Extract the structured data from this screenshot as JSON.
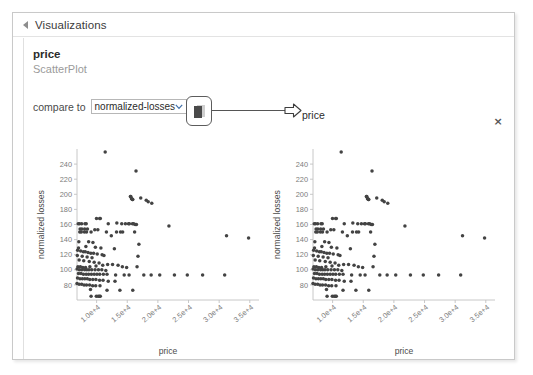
{
  "panel": {
    "title": "Visualizations",
    "collapse_icon": "triangle-right-icon"
  },
  "meta": {
    "series_name": "price",
    "plot_type": "ScatterPlot"
  },
  "compare": {
    "label": "compare to",
    "selected": "normalized-losses",
    "options": [
      "normalized-losses",
      "price",
      "symboling",
      "wheel-base",
      "curb-weight",
      "engine-size",
      "horsepower",
      "city-mpg",
      "highway-mpg"
    ],
    "chevron_icon": "chevron-down-icon"
  },
  "copy_button": {
    "icon": "copy-pages-icon",
    "label": ""
  },
  "annotation": {
    "arrow_icon": "arrow-right-outline-icon",
    "label": "price"
  },
  "close_button": {
    "label": "×",
    "icon": "close-icon"
  },
  "chart_data": [
    {
      "id": "scatter-left",
      "type": "scatter",
      "title": "",
      "xlabel": "price",
      "ylabel": "normalized losses",
      "xlim": [
        6800,
        36500
      ],
      "ylim": [
        60,
        260
      ],
      "xticks": [
        10000,
        15000,
        20000,
        25000,
        30000,
        35000
      ],
      "xticklabels": [
        "1.0e+4",
        "1.5e+4",
        "2.0e+4",
        "2.5e+4",
        "3.0e+4",
        "3.5e+4"
      ],
      "yticks": [
        80,
        100,
        120,
        140,
        160,
        180,
        200,
        220,
        240
      ],
      "yticklabels": [
        "80",
        "100",
        "120",
        "140",
        "160",
        "180",
        "200",
        "220",
        "240"
      ],
      "grid": false,
      "legend": null,
      "marker_color": "#434343",
      "points": [
        [
          11400,
          256
        ],
        [
          16430,
          231
        ],
        [
          15510,
          197
        ],
        [
          15580,
          197
        ],
        [
          15690,
          194
        ],
        [
          15750,
          194
        ],
        [
          15850,
          193
        ],
        [
          15900,
          193
        ],
        [
          17200,
          195
        ],
        [
          18100,
          192
        ],
        [
          18420,
          190
        ],
        [
          19000,
          188
        ],
        [
          9980,
          168
        ],
        [
          10500,
          168
        ],
        [
          10600,
          168
        ],
        [
          7000,
          161
        ],
        [
          7200,
          161
        ],
        [
          7550,
          161
        ],
        [
          8100,
          161
        ],
        [
          8300,
          161
        ],
        [
          11900,
          161
        ],
        [
          13300,
          162
        ],
        [
          14100,
          161
        ],
        [
          14700,
          161
        ],
        [
          15200,
          161
        ],
        [
          15350,
          161
        ],
        [
          15850,
          161
        ],
        [
          16050,
          161
        ],
        [
          16300,
          160
        ],
        [
          16500,
          160
        ],
        [
          7300,
          154
        ],
        [
          7600,
          154
        ],
        [
          8050,
          154
        ],
        [
          8500,
          154
        ],
        [
          9700,
          153
        ],
        [
          10200,
          153
        ],
        [
          7250,
          150
        ],
        [
          7500,
          150
        ],
        [
          8000,
          150
        ],
        [
          8350,
          150
        ],
        [
          9100,
          150
        ],
        [
          11600,
          150
        ],
        [
          13250,
          150
        ],
        [
          13900,
          150
        ],
        [
          14250,
          150
        ],
        [
          16200,
          150
        ],
        [
          12400,
          145
        ],
        [
          21800,
          158
        ],
        [
          31200,
          145
        ],
        [
          34800,
          142
        ],
        [
          7100,
          137
        ],
        [
          8700,
          137
        ],
        [
          9400,
          136
        ],
        [
          16900,
          134
        ],
        [
          7050,
          129
        ],
        [
          8250,
          131
        ],
        [
          9800,
          130
        ],
        [
          10700,
          129
        ],
        [
          12900,
          128
        ],
        [
          6900,
          126
        ],
        [
          7400,
          125
        ],
        [
          7850,
          124
        ],
        [
          8150,
          124
        ],
        [
          8600,
          123
        ],
        [
          9050,
          122
        ],
        [
          9500,
          122
        ],
        [
          10100,
          121
        ],
        [
          10900,
          120
        ],
        [
          11200,
          119
        ],
        [
          16750,
          118
        ],
        [
          6850,
          119
        ],
        [
          7650,
          118
        ],
        [
          8450,
          117
        ],
        [
          9250,
          116
        ],
        [
          7150,
          113
        ],
        [
          7900,
          112
        ],
        [
          8800,
          111
        ],
        [
          9600,
          110
        ],
        [
          10400,
          109
        ],
        [
          6950,
          104
        ],
        [
          7350,
          104
        ],
        [
          7750,
          103
        ],
        [
          8200,
          103
        ],
        [
          8900,
          104
        ],
        [
          9900,
          105
        ],
        [
          11000,
          106
        ],
        [
          11800,
          107
        ],
        [
          12600,
          107
        ],
        [
          13500,
          106
        ],
        [
          14200,
          104
        ],
        [
          14900,
          103
        ],
        [
          16600,
          104
        ],
        [
          6820,
          101
        ],
        [
          7200,
          100
        ],
        [
          7600,
          100
        ],
        [
          8050,
          100
        ],
        [
          8400,
          100
        ],
        [
          8750,
          100
        ],
        [
          9200,
          100
        ],
        [
          9750,
          100
        ],
        [
          10300,
          100
        ],
        [
          10850,
          100
        ],
        [
          11500,
          99
        ],
        [
          7050,
          95
        ],
        [
          7450,
          95
        ],
        [
          7850,
          94
        ],
        [
          8300,
          94
        ],
        [
          8700,
          94
        ],
        [
          9150,
          94
        ],
        [
          9600,
          94
        ],
        [
          10050,
          94
        ],
        [
          10500,
          94
        ],
        [
          11100,
          94
        ],
        [
          11700,
          94
        ],
        [
          13100,
          93
        ],
        [
          14500,
          93
        ],
        [
          15300,
          93
        ],
        [
          17700,
          93
        ],
        [
          18900,
          93
        ],
        [
          20300,
          93
        ],
        [
          22700,
          93
        ],
        [
          24800,
          93
        ],
        [
          27300,
          93
        ],
        [
          30900,
          93
        ],
        [
          6880,
          89
        ],
        [
          7280,
          88
        ],
        [
          7680,
          88
        ],
        [
          8080,
          88
        ],
        [
          8480,
          88
        ],
        [
          8880,
          87
        ],
        [
          9380,
          87
        ],
        [
          9880,
          87
        ],
        [
          10480,
          86
        ],
        [
          11050,
          86
        ],
        [
          11900,
          85
        ],
        [
          13000,
          85
        ],
        [
          6800,
          82
        ],
        [
          7150,
          81
        ],
        [
          7550,
          81
        ],
        [
          7950,
          80
        ],
        [
          8350,
          80
        ],
        [
          8850,
          80
        ],
        [
          9350,
          79
        ],
        [
          9850,
          79
        ],
        [
          10550,
          79
        ],
        [
          9000,
          74
        ],
        [
          11700,
          73
        ],
        [
          13800,
          73
        ],
        [
          15900,
          73
        ],
        [
          9100,
          65
        ],
        [
          9950,
          65
        ],
        [
          10250,
          65
        ],
        [
          10450,
          65
        ],
        [
          10600,
          65
        ]
      ]
    },
    {
      "id": "scatter-right",
      "type": "scatter",
      "title": "",
      "xlabel": "price",
      "ylabel": "normalized losses",
      "xlim": [
        6800,
        36500
      ],
      "ylim": [
        60,
        260
      ],
      "xticks": [
        10000,
        15000,
        20000,
        25000,
        30000,
        35000
      ],
      "xticklabels": [
        "1.0e+4",
        "1.5e+4",
        "2.0e+4",
        "2.5e+4",
        "3.0e+4",
        "3.5e+4"
      ],
      "yticks": [
        80,
        100,
        120,
        140,
        160,
        180,
        200,
        220,
        240
      ],
      "yticklabels": [
        "80",
        "100",
        "120",
        "140",
        "160",
        "180",
        "200",
        "220",
        "240"
      ],
      "grid": false,
      "legend": null,
      "marker_color": "#434343",
      "points": [
        [
          11400,
          256
        ],
        [
          16430,
          231
        ],
        [
          15510,
          197
        ],
        [
          15580,
          197
        ],
        [
          15690,
          194
        ],
        [
          15750,
          194
        ],
        [
          15850,
          193
        ],
        [
          15900,
          193
        ],
        [
          17200,
          195
        ],
        [
          18100,
          192
        ],
        [
          18420,
          190
        ],
        [
          19000,
          188
        ],
        [
          9980,
          168
        ],
        [
          10500,
          168
        ],
        [
          10600,
          168
        ],
        [
          7000,
          161
        ],
        [
          7200,
          161
        ],
        [
          7550,
          161
        ],
        [
          8100,
          161
        ],
        [
          8300,
          161
        ],
        [
          11900,
          161
        ],
        [
          13300,
          162
        ],
        [
          14100,
          161
        ],
        [
          14700,
          161
        ],
        [
          15200,
          161
        ],
        [
          15350,
          161
        ],
        [
          15850,
          161
        ],
        [
          16050,
          161
        ],
        [
          16300,
          160
        ],
        [
          16500,
          160
        ],
        [
          7300,
          154
        ],
        [
          7600,
          154
        ],
        [
          8050,
          154
        ],
        [
          8500,
          154
        ],
        [
          9700,
          153
        ],
        [
          10200,
          153
        ],
        [
          7250,
          150
        ],
        [
          7500,
          150
        ],
        [
          8000,
          150
        ],
        [
          8350,
          150
        ],
        [
          9100,
          150
        ],
        [
          11600,
          150
        ],
        [
          13250,
          150
        ],
        [
          13900,
          150
        ],
        [
          14250,
          150
        ],
        [
          16200,
          150
        ],
        [
          12400,
          145
        ],
        [
          21800,
          158
        ],
        [
          31200,
          145
        ],
        [
          34800,
          142
        ],
        [
          7100,
          137
        ],
        [
          8700,
          137
        ],
        [
          9400,
          136
        ],
        [
          16900,
          134
        ],
        [
          7050,
          129
        ],
        [
          8250,
          131
        ],
        [
          9800,
          130
        ],
        [
          10700,
          129
        ],
        [
          12900,
          128
        ],
        [
          6900,
          126
        ],
        [
          7400,
          125
        ],
        [
          7850,
          124
        ],
        [
          8150,
          124
        ],
        [
          8600,
          123
        ],
        [
          9050,
          122
        ],
        [
          9500,
          122
        ],
        [
          10100,
          121
        ],
        [
          10900,
          120
        ],
        [
          11200,
          119
        ],
        [
          16750,
          118
        ],
        [
          6850,
          119
        ],
        [
          7650,
          118
        ],
        [
          8450,
          117
        ],
        [
          9250,
          116
        ],
        [
          7150,
          113
        ],
        [
          7900,
          112
        ],
        [
          8800,
          111
        ],
        [
          9600,
          110
        ],
        [
          10400,
          109
        ],
        [
          6950,
          104
        ],
        [
          7350,
          104
        ],
        [
          7750,
          103
        ],
        [
          8200,
          103
        ],
        [
          8900,
          104
        ],
        [
          9900,
          105
        ],
        [
          11000,
          106
        ],
        [
          11800,
          107
        ],
        [
          12600,
          107
        ],
        [
          13500,
          106
        ],
        [
          14200,
          104
        ],
        [
          14900,
          103
        ],
        [
          16600,
          104
        ],
        [
          6820,
          101
        ],
        [
          7200,
          100
        ],
        [
          7600,
          100
        ],
        [
          8050,
          100
        ],
        [
          8400,
          100
        ],
        [
          8750,
          100
        ],
        [
          9200,
          100
        ],
        [
          9750,
          100
        ],
        [
          10300,
          100
        ],
        [
          10850,
          100
        ],
        [
          11500,
          99
        ],
        [
          7050,
          95
        ],
        [
          7450,
          95
        ],
        [
          7850,
          94
        ],
        [
          8300,
          94
        ],
        [
          8700,
          94
        ],
        [
          9150,
          94
        ],
        [
          9600,
          94
        ],
        [
          10050,
          94
        ],
        [
          10500,
          94
        ],
        [
          11100,
          94
        ],
        [
          11700,
          94
        ],
        [
          13100,
          93
        ],
        [
          14500,
          93
        ],
        [
          15300,
          93
        ],
        [
          17700,
          93
        ],
        [
          18900,
          93
        ],
        [
          20300,
          93
        ],
        [
          22700,
          93
        ],
        [
          24800,
          93
        ],
        [
          27300,
          93
        ],
        [
          30900,
          93
        ],
        [
          6880,
          89
        ],
        [
          7280,
          88
        ],
        [
          7680,
          88
        ],
        [
          8080,
          88
        ],
        [
          8480,
          88
        ],
        [
          8880,
          87
        ],
        [
          9380,
          87
        ],
        [
          9880,
          87
        ],
        [
          10480,
          86
        ],
        [
          11050,
          86
        ],
        [
          11900,
          85
        ],
        [
          13000,
          85
        ],
        [
          6800,
          82
        ],
        [
          7150,
          81
        ],
        [
          7550,
          81
        ],
        [
          7950,
          80
        ],
        [
          8350,
          80
        ],
        [
          8850,
          80
        ],
        [
          9350,
          79
        ],
        [
          9850,
          79
        ],
        [
          10550,
          79
        ],
        [
          9000,
          74
        ],
        [
          11700,
          73
        ],
        [
          13800,
          73
        ],
        [
          15900,
          73
        ],
        [
          9100,
          65
        ],
        [
          9950,
          65
        ],
        [
          10250,
          65
        ],
        [
          10450,
          65
        ],
        [
          10600,
          65
        ]
      ]
    }
  ]
}
